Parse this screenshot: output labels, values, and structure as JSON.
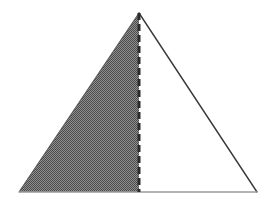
{
  "figure": {
    "canvas": {
      "width": 272,
      "height": 203,
      "background_color": "#ffffff"
    },
    "triangle": {
      "name": "main-triangle",
      "vertices": {
        "apex": {
          "x": 139,
          "y": 13
        },
        "bottom_left": {
          "x": 19,
          "y": 192
        },
        "bottom_right": {
          "x": 257,
          "y": 192
        }
      },
      "outline_color": "#3a3a3a",
      "outline_width": 1.4
    },
    "divider": {
      "name": "dashed-altitude-line",
      "from": {
        "x": 139,
        "y": 13
      },
      "to": {
        "x": 139,
        "y": 192
      },
      "color": "#2b2b2b",
      "width": 3,
      "dash_length": 7,
      "gap_length": 4
    },
    "left_region": {
      "name": "shaded-left-subtriangle",
      "fill_style": "checkerboard-dither",
      "fill_color_dark": "#4a4a4a",
      "fill_color_light": "#909090",
      "fill_color_average": "#6d6d6d",
      "points": "19,192 139,13 139,192"
    },
    "right_region": {
      "name": "unshaded-right-subtriangle",
      "fill_style": "solid",
      "fill_color": "#ffffff",
      "points": "139,13 257,192 139,192"
    },
    "baseline": {
      "name": "triangle-base-line",
      "from": {
        "x": 19,
        "y": 192
      },
      "to": {
        "x": 257,
        "y": 192
      },
      "color": "#9a9a9a",
      "width": 1.3
    }
  },
  "chart_data": {
    "type": "diagram",
    "shapes": [
      {
        "label": "main-triangle",
        "kind": "triangle",
        "points": [
          [
            19,
            192
          ],
          [
            139,
            13
          ],
          [
            257,
            192
          ]
        ]
      },
      {
        "label": "shaded-left-subtriangle",
        "kind": "triangle",
        "points": [
          [
            19,
            192
          ],
          [
            139,
            13
          ],
          [
            139,
            192
          ]
        ],
        "fill": "hatched-gray"
      },
      {
        "label": "unshaded-right-subtriangle",
        "kind": "triangle",
        "points": [
          [
            139,
            13
          ],
          [
            257,
            192
          ],
          [
            139,
            192
          ]
        ],
        "fill": "white"
      },
      {
        "label": "dashed-altitude-line",
        "kind": "segment",
        "points": [
          [
            139,
            13
          ],
          [
            139,
            192
          ]
        ],
        "stroke": "dashed"
      }
    ],
    "annotations": [],
    "legend": []
  }
}
